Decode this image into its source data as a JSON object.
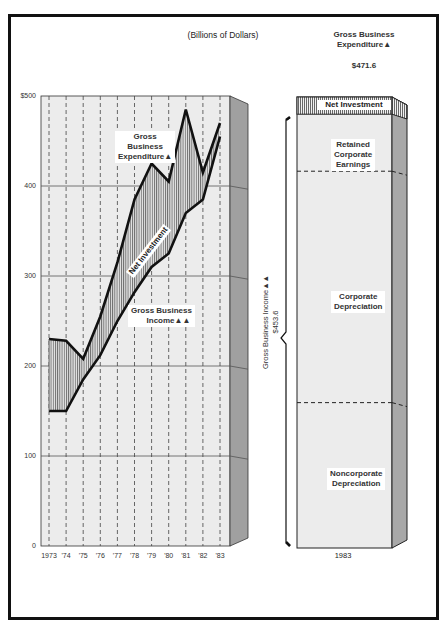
{
  "subtitle": "(Billions of Dollars)",
  "chart_data": [
    {
      "type": "line",
      "title": "(Billions of Dollars)",
      "x": [
        "1973",
        "'74",
        "'75",
        "'76",
        "'77",
        "'78",
        "'79",
        "'80",
        "'81",
        "'82",
        "'83"
      ],
      "series": [
        {
          "name": "Gross Business Expenditure",
          "marker": "▲",
          "values": [
            230,
            228,
            208,
            255,
            315,
            385,
            425,
            405,
            485,
            415,
            470
          ]
        },
        {
          "name": "Gross Business Income",
          "marker": "▲▲",
          "values": [
            150,
            150,
            185,
            212,
            250,
            282,
            310,
            325,
            370,
            385,
            455
          ]
        }
      ],
      "shaded_area": "Net Investment",
      "yticks": [
        "$500",
        "400",
        "300",
        "200",
        "100",
        "0"
      ],
      "ylim": [
        0,
        500
      ],
      "grid": true,
      "xlabel": "",
      "ylabel": ""
    },
    {
      "type": "bar",
      "stacked": true,
      "categories": [
        "1983"
      ],
      "series": [
        {
          "name": "Noncorporate Depreciation",
          "values": [
            152
          ]
        },
        {
          "name": "Corporate Depreciation",
          "values": [
            242
          ]
        },
        {
          "name": "Retained Corporate Earnings",
          "values": [
            59.6
          ]
        },
        {
          "name": "Net Investment",
          "values": [
            18
          ]
        }
      ],
      "total_top_label": "Gross Business Expenditure▲",
      "total_value": "$471.6",
      "bracket_label": "Gross Business Income▲▲",
      "bracket_value": "$453.6"
    }
  ],
  "left_chart": {
    "yticks": [
      "$500",
      "400",
      "300",
      "200",
      "100",
      "0"
    ],
    "xticks": [
      "1973",
      "'74",
      "'75",
      "'76",
      "'77",
      "'78",
      "'79",
      "'80",
      "'81",
      "'82",
      "'83"
    ],
    "labels": {
      "expenditure": [
        "Gross",
        "Business",
        "Expenditure▲"
      ],
      "net_investment": "Net Investment",
      "income": [
        "Gross Business",
        "Income▲▲"
      ]
    }
  },
  "right_chart": {
    "top_label": [
      "Gross Business",
      "Expenditure▲"
    ],
    "top_value": "$471.6",
    "segments": {
      "net_investment": "Net Investment",
      "retained": [
        "Retained",
        "Corporate",
        "Earnings"
      ],
      "corporate": [
        "Corporate",
        "Depreciation"
      ],
      "noncorporate": [
        "Noncorporate",
        "Depreciation"
      ]
    },
    "bracket_label": "Gross Business Income▲▲",
    "bracket_value": "$453.6",
    "xlabel": "1983"
  },
  "colors": {
    "frame": "#111111",
    "plot_bg": "#ececec",
    "side_face": "#9a9a9a",
    "line": "#111111",
    "hatch": "#555555"
  }
}
